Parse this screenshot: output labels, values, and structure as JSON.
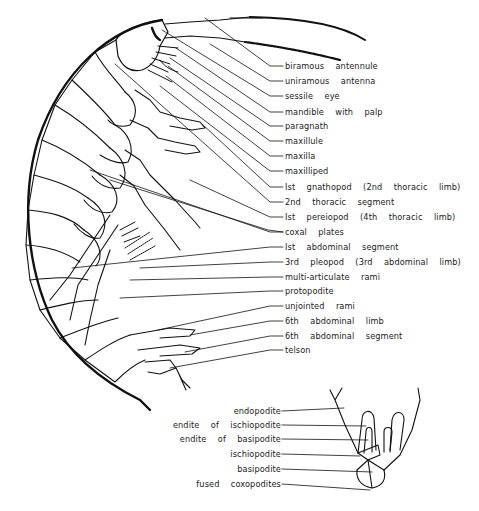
{
  "figure": {
    "ink_color": "#111111",
    "background": "#ffffff"
  },
  "body_labels": [
    {
      "text": "biramous  antennule",
      "y": 66
    },
    {
      "text": "uniramous  antenna",
      "y": 81
    },
    {
      "text": "sessile  eye",
      "y": 96
    },
    {
      "text": "mandible  with  palp",
      "y": 112
    },
    {
      "text": "paragnath",
      "y": 126
    },
    {
      "text": "maxillule",
      "y": 141
    },
    {
      "text": "maxilla",
      "y": 156
    },
    {
      "text": "maxilliped",
      "y": 171
    },
    {
      "text": "Ist  gnathopod  (2nd  thoracic  limb)",
      "y": 187
    },
    {
      "text": "2nd  thoracic  segment",
      "y": 202
    },
    {
      "text": "Ist  pereiopod  (4th  thoracic  limb)",
      "y": 217
    },
    {
      "text": "coxal  plates",
      "y": 232
    },
    {
      "text": "Ist  abdominal  segment",
      "y": 247
    },
    {
      "text": "3rd  pleopod  (3rd  abdominal  limb)",
      "y": 262
    },
    {
      "text": "multi-articulate  rami",
      "y": 277
    },
    {
      "text": "protopodite",
      "y": 291
    },
    {
      "text": "unjointed  rami",
      "y": 306
    },
    {
      "text": "6th  abdominal  limb",
      "y": 321
    },
    {
      "text": "6th  abdominal  segment",
      "y": 336
    },
    {
      "text": "telson",
      "y": 350
    }
  ],
  "appendage_labels": [
    {
      "text": "endopodite",
      "y": 411
    },
    {
      "text": "endite  of  ischiopodite",
      "y": 425
    },
    {
      "text": "endite  of  basipodite",
      "y": 439
    },
    {
      "text": "ischiopodite",
      "y": 454
    },
    {
      "text": "basipodite",
      "y": 469
    },
    {
      "text": "fused  coxopodites",
      "y": 484
    }
  ]
}
